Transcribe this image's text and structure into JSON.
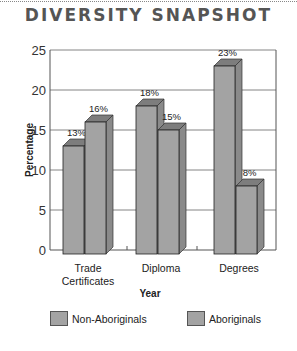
{
  "header": {
    "title": "DIVERSITY SNAPSHOT"
  },
  "chart_data": {
    "type": "bar",
    "title": "DIVERSITY SNAPSHOT",
    "xlabel": "Year",
    "ylabel": "Percentage",
    "ylim": [
      0,
      25
    ],
    "yticks": [
      0,
      5,
      10,
      15,
      20,
      25
    ],
    "grid": true,
    "legend_position": "bottom",
    "categories": [
      "Trade Certificates",
      "Diploma",
      "Degrees"
    ],
    "series": [
      {
        "name": "Non-Aboriginals",
        "values": [
          13,
          18,
          23
        ],
        "labels": [
          "13%",
          "18%",
          "23%"
        ]
      },
      {
        "name": "Aboriginals",
        "values": [
          16,
          15,
          8
        ],
        "labels": [
          "16%",
          "15%",
          "8%"
        ]
      }
    ],
    "bar_color": "#a3a3a3"
  },
  "legend": {
    "items": [
      "Non-Aboriginals",
      "Aboriginals"
    ]
  }
}
